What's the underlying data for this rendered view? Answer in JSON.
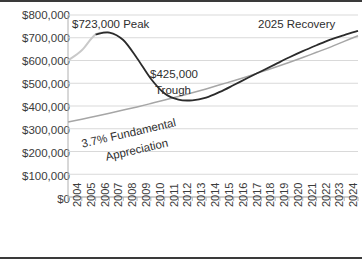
{
  "chart_data": {
    "type": "line",
    "title": "",
    "xlabel": "",
    "ylabel": "",
    "grid": true,
    "legend_position": "none",
    "ylim": [
      0,
      800000
    ],
    "ytick_labels": [
      "$800,000",
      "$700,000",
      "$600,000",
      "$500,000",
      "$400,000",
      "$300,000",
      "$200,000",
      "$100,000",
      "$0"
    ],
    "ytick_values": [
      800000,
      700000,
      600000,
      500000,
      400000,
      300000,
      200000,
      100000,
      0
    ],
    "categories": [
      "2004",
      "2005",
      "2006",
      "2007",
      "2008",
      "2009",
      "2010",
      "2011",
      "2012",
      "2013",
      "2014",
      "2015",
      "2016",
      "2017",
      "2018",
      "2019",
      "2020",
      "2021",
      "2022",
      "2023",
      "2024",
      "2025"
    ],
    "series": [
      {
        "name": "Home Value Cycle",
        "color": "#2b2b2b",
        "values": [
          600000,
          645000,
          715000,
          723000,
          690000,
          610000,
          520000,
          455000,
          428000,
          425000,
          437000,
          462000,
          492000,
          523000,
          553000,
          583000,
          613000,
          641000,
          667000,
          692000,
          712000,
          730000
        ]
      },
      {
        "name": "3.7% Fundamental Appreciation Trend",
        "color": "#a6a6a6",
        "values": [
          330000,
          342000,
          355000,
          368000,
          382000,
          396000,
          411000,
          426000,
          442000,
          458000,
          475000,
          493000,
          511000,
          530000,
          550000,
          570000,
          591000,
          613000,
          636000,
          659000,
          684000,
          709000
        ]
      }
    ],
    "annotations": [
      {
        "name": "peak-annotation",
        "text": "$723,000 Peak",
        "value": 723000,
        "year": "2007"
      },
      {
        "name": "trough-annotation-amount",
        "text": "$425,000",
        "value": 425000,
        "year": "2013"
      },
      {
        "name": "trough-annotation-label",
        "text": "Trough"
      },
      {
        "name": "trend-annotation-line1",
        "text": "3.7% Fundamental"
      },
      {
        "name": "trend-annotation-line2",
        "text": "Appreciation"
      },
      {
        "name": "recovery-annotation",
        "text": "2025 Recovery",
        "year": "2025"
      }
    ]
  },
  "colors": {
    "cycle_line": "#2b2b2b",
    "trend_line": "#a6a6a6",
    "grid": "#d9d9d9",
    "axis": "#b0b0b0",
    "text": "#3b3b3b",
    "frame": "#3a3a3a"
  }
}
